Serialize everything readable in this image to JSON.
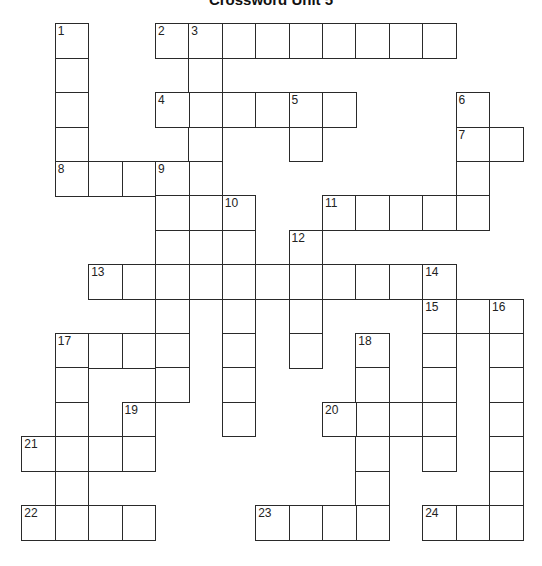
{
  "title": "Crossword Unit 5",
  "grid": {
    "origin_x": 22,
    "origin_y": 24,
    "cell_w": 33.4,
    "cell_h": 34.4,
    "colors": {
      "line": "#2a2a2a",
      "cell": "#ffffff"
    }
  },
  "entries": [
    {
      "number": "1",
      "direction": "down",
      "row": 0,
      "col": 1,
      "length": 5
    },
    {
      "number": "2",
      "direction": "across",
      "row": 0,
      "col": 4,
      "length": 9
    },
    {
      "number": "3",
      "direction": "down",
      "row": 0,
      "col": 5,
      "length": 8
    },
    {
      "number": "4",
      "direction": "across",
      "row": 2,
      "col": 4,
      "length": 6
    },
    {
      "number": "5",
      "direction": "down",
      "row": 2,
      "col": 8,
      "length": 2
    },
    {
      "number": "6",
      "direction": "down",
      "row": 2,
      "col": 13,
      "length": 4
    },
    {
      "number": "7",
      "direction": "across",
      "row": 3,
      "col": 13,
      "length": 2
    },
    {
      "number": "8",
      "direction": "across",
      "row": 4,
      "col": 1,
      "length": 5
    },
    {
      "number": "9",
      "direction": "down",
      "row": 4,
      "col": 4,
      "length": 7
    },
    {
      "number": "10",
      "direction": "down",
      "row": 5,
      "col": 6,
      "length": 7
    },
    {
      "number": "11",
      "direction": "across",
      "row": 5,
      "col": 9,
      "length": 5
    },
    {
      "number": "12",
      "direction": "down",
      "row": 6,
      "col": 8,
      "length": 4
    },
    {
      "number": "13",
      "direction": "across",
      "row": 7,
      "col": 2,
      "length": 11
    },
    {
      "number": "14",
      "direction": "down",
      "row": 7,
      "col": 12,
      "length": 6
    },
    {
      "number": "15",
      "direction": "across",
      "row": 8,
      "col": 12,
      "length": 3
    },
    {
      "number": "16",
      "direction": "down",
      "row": 8,
      "col": 14,
      "length": 7
    },
    {
      "number": "17",
      "direction": "across",
      "row": 9,
      "col": 1,
      "length": 4
    },
    {
      "number": "17",
      "direction": "down",
      "row": 9,
      "col": 1,
      "length": 6
    },
    {
      "number": "18",
      "direction": "down",
      "row": 9,
      "col": 10,
      "length": 6
    },
    {
      "number": "19",
      "direction": "down",
      "row": 11,
      "col": 3,
      "length": 2
    },
    {
      "number": "20",
      "direction": "across",
      "row": 11,
      "col": 9,
      "length": 4
    },
    {
      "number": "21",
      "direction": "across",
      "row": 12,
      "col": 0,
      "length": 4
    },
    {
      "number": "22",
      "direction": "across",
      "row": 14,
      "col": 0,
      "length": 4
    },
    {
      "number": "23",
      "direction": "across",
      "row": 14,
      "col": 7,
      "length": 4
    },
    {
      "number": "24",
      "direction": "across",
      "row": 14,
      "col": 12,
      "length": 3
    }
  ]
}
